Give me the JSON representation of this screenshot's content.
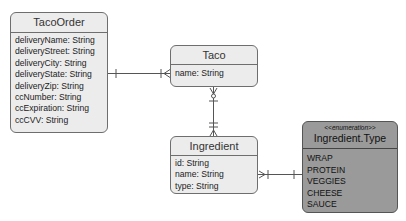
{
  "diagram": {
    "type": "entity-relationship",
    "entities": [
      {
        "id": "taco_order",
        "title": "TacoOrder",
        "attributes": [
          "deliveryName: String",
          "deliveryStreet: String",
          "deliveryCity: String",
          "deliveryState: String",
          "deliveryZip: String",
          "ccNumber: String",
          "ccExpiration: String",
          "ccCVV: String"
        ]
      },
      {
        "id": "taco",
        "title": "Taco",
        "attributes": [
          "name: String"
        ]
      },
      {
        "id": "ingredient",
        "title": "Ingredient",
        "attributes": [
          "id: String",
          "name: String",
          "type: String"
        ]
      },
      {
        "id": "ingredient_type",
        "stereotype": "<<enumeration>>",
        "title": "Ingredient.Type",
        "values": [
          "WRAP",
          "PROTEIN",
          "VEGGIES",
          "CHEESE",
          "SAUCE"
        ]
      }
    ],
    "relationships": [
      {
        "from": "TacoOrder",
        "to": "Taco",
        "from_end": "one",
        "to_end": "one-or-many"
      },
      {
        "from": "Taco",
        "to": "Ingredient",
        "from_end": "zero-or-many",
        "to_end": "one-or-many"
      },
      {
        "from": "Ingredient",
        "to": "Ingredient.Type",
        "from_end": "zero-or-many",
        "to_end": "one"
      }
    ],
    "colors": {
      "entity_fill": "#ececec",
      "enum_fill": "#9a9a9a",
      "border": "#6e6e6e",
      "line": "#555555"
    }
  }
}
